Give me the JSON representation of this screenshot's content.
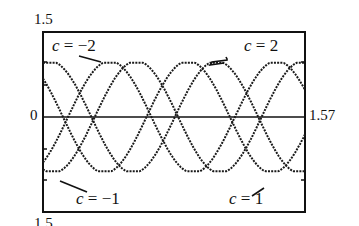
{
  "chart_data": {
    "type": "line",
    "title": "",
    "xlabel": "",
    "ylabel": "",
    "xlim": [
      0,
      1.57
    ],
    "ylim": [
      -1.5,
      1.5
    ],
    "grid": false,
    "legend": "none (inline curve annotations)",
    "tick_labels": {
      "y_top": "1.5",
      "y_zero": "0",
      "y_bottom": "-1.5",
      "x_right": "1.57"
    },
    "model": "y = cos(2*pi*(x - p)), amplitude 1, period approx 1.0",
    "x": [
      0,
      0.0785,
      0.157,
      0.2355,
      0.314,
      0.3925,
      0.471,
      0.5495,
      0.628,
      0.7065,
      0.785,
      0.8635,
      0.942,
      1.0205,
      1.099,
      1.1775,
      1.256,
      1.3345,
      1.413,
      1.4915,
      1.57
    ],
    "series": [
      {
        "name": "c = -2",
        "phase": 0.04,
        "values": [
          0.97,
          0.97,
          0.74,
          0.34,
          -0.15,
          -0.6,
          -0.91,
          -1.0,
          -0.85,
          -0.5,
          -0.03,
          0.45,
          0.82,
          0.99,
          0.93,
          0.65,
          0.21,
          -0.28,
          -0.7,
          -0.96,
          -0.98
        ]
      },
      {
        "name": "c = -1",
        "phase": 0.4,
        "values": [
          -0.81,
          -0.43,
          0.04,
          0.51,
          0.86,
          1.0,
          0.9,
          0.59,
          0.14,
          -0.35,
          -0.75,
          -0.97,
          -0.97,
          -0.73,
          -0.31,
          0.17,
          0.62,
          0.92,
          0.99,
          0.84,
          0.48
        ]
      },
      {
        "name": "c = 1",
        "phase": 0.56,
        "values": [
          -0.93,
          -0.99,
          -0.82,
          -0.45,
          0.02,
          0.5,
          0.85,
          1.0,
          0.91,
          0.61,
          0.16,
          -0.33,
          -0.74,
          -0.97,
          -0.97,
          -0.74,
          -0.33,
          0.15,
          0.6,
          0.91,
          1.0
        ]
      },
      {
        "name": "c = 2",
        "phase": 0.87,
        "values": [
          0.68,
          0.26,
          -0.23,
          -0.67,
          -0.94,
          -0.99,
          -0.81,
          -0.43,
          0.05,
          0.52,
          0.86,
          1.0,
          0.9,
          0.59,
          0.13,
          -0.35,
          -0.75,
          -0.98,
          -0.96,
          -0.72,
          -0.31
        ]
      }
    ],
    "annotations": [
      {
        "text_var": "c",
        "text_rest": " = −2",
        "near": "top-left"
      },
      {
        "text_var": "c",
        "text_rest": " = 2",
        "near": "top-right"
      },
      {
        "text_var": "c",
        "text_rest": " = −1",
        "near": "bottom-left"
      },
      {
        "text_var": "c",
        "text_rest": " = 1",
        "near": "bottom-right"
      }
    ]
  },
  "labels": {
    "y_top": "1.5",
    "y_zero": "0",
    "y_bottom": "-1.5",
    "x_right": "1.57",
    "c_var": "c",
    "ann_m2": " = −2",
    "ann_p2": " = 2",
    "ann_m1": " = −1",
    "ann_p1": " = 1"
  },
  "colors": {
    "curve": "#1a1a1a",
    "frame": "#111111",
    "background": "#ffffff"
  }
}
